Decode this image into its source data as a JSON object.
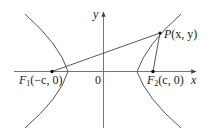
{
  "figure": {
    "type": "hyperbola-foci-diagram",
    "axes": {
      "x_label": "x",
      "y_label": "y",
      "origin_label": "0"
    },
    "points": {
      "focus1": {
        "name": "F",
        "subscript": "1",
        "coords": "(−c, 0)"
      },
      "focus2": {
        "name": "F",
        "subscript": "2",
        "coords": "(c, 0)"
      },
      "point_p": {
        "name": "P",
        "coords": "(x, y)"
      }
    },
    "colors": {
      "curve": "#555555",
      "axis": "#666666",
      "text": "#222222"
    }
  }
}
